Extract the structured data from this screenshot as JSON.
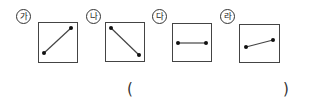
{
  "figures": [
    {
      "label": "가",
      "circled_label": "㉮",
      "box": {
        "x": 38,
        "y": 22,
        "w": 40,
        "h": 41
      },
      "label_pos": {
        "x": 16,
        "y": 9
      },
      "segment": {
        "x1": 44,
        "y1": 53,
        "x2": 71,
        "y2": 28
      }
    },
    {
      "label": "나",
      "circled_label": "㉯",
      "box": {
        "x": 105,
        "y": 22,
        "w": 40,
        "h": 40
      },
      "label_pos": {
        "x": 86,
        "y": 9
      },
      "segment": {
        "x1": 111,
        "y1": 28,
        "x2": 139,
        "y2": 55
      }
    },
    {
      "label": "다",
      "circled_label": "㉰",
      "box": {
        "x": 172,
        "y": 23,
        "w": 40,
        "h": 39
      },
      "label_pos": {
        "x": 152,
        "y": 9
      },
      "segment": {
        "x1": 178,
        "y1": 43,
        "x2": 206,
        "y2": 43
      }
    },
    {
      "label": "라",
      "circled_label": "㉱",
      "box": {
        "x": 239,
        "y": 24,
        "w": 41,
        "h": 39
      },
      "label_pos": {
        "x": 220,
        "y": 9
      },
      "segment": {
        "x1": 246,
        "y1": 47,
        "x2": 273,
        "y2": 40
      }
    }
  ],
  "answer": {
    "open_paren": "(",
    "close_paren": ")",
    "value": ""
  },
  "colors": {
    "line": "#444444",
    "dot": "#111111",
    "border": "#444444"
  }
}
